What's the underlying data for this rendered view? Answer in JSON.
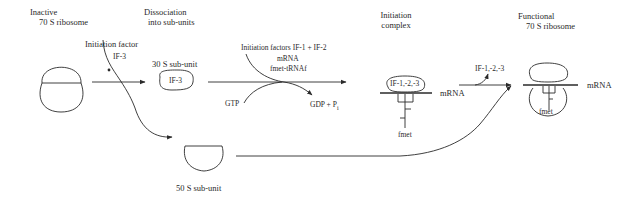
{
  "diagram": {
    "stages": {
      "inactive": {
        "line1": "Inactive",
        "line2": "70 S ribosome"
      },
      "dissociation": {
        "line1": "Dissociation",
        "line2": "into sub-units"
      },
      "initiation_complex": {
        "line1": "Initiation",
        "line2": "complex"
      },
      "functional": {
        "line1": "Functional",
        "line2": "70 S ribosome"
      }
    },
    "labels": {
      "initiation_factor": "Initiation factor",
      "if3": "IF-3",
      "subunit_30s": "30 S sub-unit",
      "subunit_30s_inner": "IF-3",
      "subunit_50s": "50 S sub-unit",
      "initiation_factors": "Initiation factors IF-1 + IF-2",
      "mrna_input": "mRNA",
      "fmet_trna": "fmet-tRNAf",
      "gtp": "GTP",
      "gdp": "GDP + P",
      "gdp_sub": "i",
      "complex_inner": "IF-1,-2,-3",
      "complex_mrna": "mRNA",
      "complex_fmet": "fmet",
      "released_factors": "IF-1,-2,-3",
      "functional_mrna": "mRNA",
      "functional_fmet": "fmet"
    },
    "colors": {
      "line": "#2a2a2a",
      "background": "#ffffff"
    }
  }
}
